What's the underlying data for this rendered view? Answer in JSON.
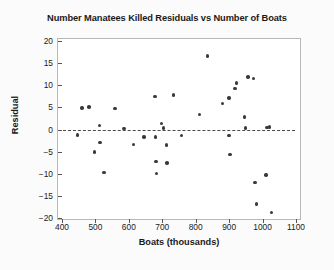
{
  "chart_data": {
    "type": "scatter",
    "title": "Number Manatees Killed Residuals vs Number of Boats",
    "xlabel": "Boats (thousands)",
    "ylabel": "Residual",
    "xlim": [
      400,
      1100
    ],
    "ylim": [
      -20,
      20
    ],
    "xticks": [
      400,
      500,
      600,
      700,
      800,
      900,
      1000,
      1100
    ],
    "yticks": [
      20,
      15,
      10,
      5,
      0,
      -5,
      -10,
      -15,
      -20
    ],
    "grid": false,
    "legend": null,
    "reference_line": {
      "type": "horizontal-dashed",
      "y": 0,
      "label": "zero residual line"
    },
    "points": [
      {
        "x": 447,
        "y": -1.2
      },
      {
        "x": 460,
        "y": 4.9
      },
      {
        "x": 481,
        "y": 5.1
      },
      {
        "x": 497,
        "y": -5.1
      },
      {
        "x": 512,
        "y": 0.9
      },
      {
        "x": 514,
        "y": -2.9
      },
      {
        "x": 526,
        "y": -9.7
      },
      {
        "x": 559,
        "y": 4.8
      },
      {
        "x": 585,
        "y": 0.2
      },
      {
        "x": 614,
        "y": -3.4
      },
      {
        "x": 645,
        "y": -1.7
      },
      {
        "x": 678,
        "y": 7.5
      },
      {
        "x": 679,
        "y": -1.7
      },
      {
        "x": 681,
        "y": -7.2
      },
      {
        "x": 682,
        "y": -10.0
      },
      {
        "x": 697,
        "y": 1.4
      },
      {
        "x": 703,
        "y": 0.3
      },
      {
        "x": 712,
        "y": -3.5
      },
      {
        "x": 714,
        "y": -7.6
      },
      {
        "x": 733,
        "y": 7.8
      },
      {
        "x": 758,
        "y": -1.4
      },
      {
        "x": 812,
        "y": 3.4
      },
      {
        "x": 835,
        "y": 16.6
      },
      {
        "x": 881,
        "y": 5.9
      },
      {
        "x": 899,
        "y": 7.1
      },
      {
        "x": 900,
        "y": -1.3
      },
      {
        "x": 903,
        "y": -5.6
      },
      {
        "x": 917,
        "y": 9.2
      },
      {
        "x": 922,
        "y": 10.5
      },
      {
        "x": 946,
        "y": 2.8
      },
      {
        "x": 949,
        "y": 0.3
      },
      {
        "x": 956,
        "y": 11.9
      },
      {
        "x": 973,
        "y": 11.5
      },
      {
        "x": 977,
        "y": -12.0
      },
      {
        "x": 982,
        "y": -16.8
      },
      {
        "x": 1010,
        "y": -10.3
      },
      {
        "x": 1013,
        "y": 0.5
      },
      {
        "x": 1021,
        "y": 0.6
      },
      {
        "x": 1027,
        "y": -18.8
      }
    ]
  }
}
